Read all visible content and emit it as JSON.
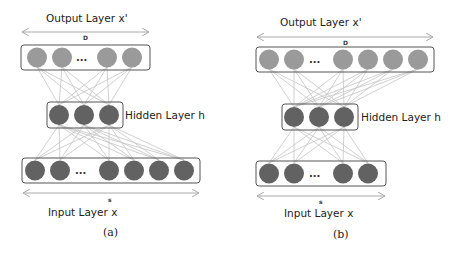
{
  "colors": {
    "output_node": "#9a9a9a",
    "hidden_node": "#626262",
    "input_node": "#626262",
    "edge": "#c4c4c4",
    "box_stroke": "#555555"
  },
  "diagrams": [
    {
      "caption": "(a)",
      "output_label": "Output Layer x'",
      "output_dim": "D",
      "hidden_label": "Hidden Layer h",
      "input_label": "Input Layer x",
      "input_dim": "s",
      "output_nodes_visible": 4,
      "hidden_nodes": 3,
      "input_nodes_visible": 6,
      "ellipsis": "..."
    },
    {
      "caption": "(b)",
      "output_label": "Output Layer x'",
      "output_dim": "D",
      "hidden_label": "Hidden Layer h",
      "input_label": "Input Layer x",
      "input_dim": "s",
      "output_nodes_visible": 6,
      "hidden_nodes": 3,
      "input_nodes_visible": 4,
      "ellipsis": "..."
    }
  ]
}
